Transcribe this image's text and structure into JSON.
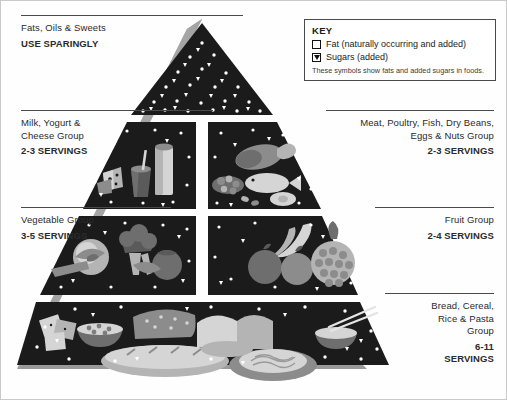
{
  "diagram": {
    "colors": {
      "tier_dark": "#1b1b1b",
      "side_shadow": "#9a9a9a",
      "rule": "#4a4a4a",
      "symbol_white": "#ffffff",
      "background": "#fefefe"
    }
  },
  "labels": {
    "fats": {
      "name": "Fats, Oils & Sweets",
      "servings": "USE SPARINGLY"
    },
    "milk": {
      "name_line1": "Milk, Yogurt &",
      "name_line2": "Cheese Group",
      "servings": "2-3 SERVINGS"
    },
    "vegetable": {
      "name": "Vegetable Group",
      "servings": "3-5 SERVINGS"
    },
    "meat": {
      "name_line1": "Meat, Poultry, Fish, Dry Beans,",
      "name_line2": "Eggs & Nuts Group",
      "servings": "2-3 SERVINGS"
    },
    "fruit": {
      "name": "Fruit Group",
      "servings": "2-4 SERVINGS"
    },
    "bread": {
      "name_line1": "Bread, Cereal,",
      "name_line2": "Rice & Pasta",
      "name_line3": "Group",
      "servings_line1": "6-11",
      "servings_line2": "SERVINGS"
    }
  },
  "key": {
    "title": "KEY",
    "items": [
      {
        "symbol": "open-square",
        "label": "Fat (naturally occurring and added)"
      },
      {
        "symbol": "filled-triangle",
        "label": "Sugars (added)"
      }
    ],
    "note": "These symbols show fats and added sugars in foods."
  }
}
